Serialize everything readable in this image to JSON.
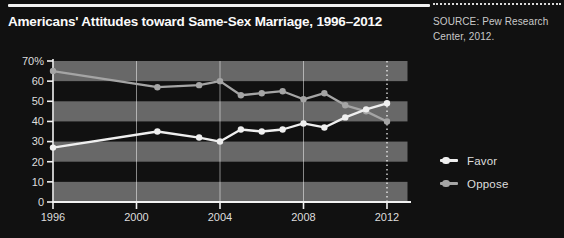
{
  "title": "Americans' Attitudes toward Same-Sex Marriage, 1996–2012",
  "source": {
    "line1": "SOURCE: Pew Research",
    "line2": "Center, 2012."
  },
  "colors": {
    "background": "#111111",
    "band": "#686868",
    "axis": "#f2f2f2",
    "tick_label": "#dedede",
    "grid": "rgba(255,255,255,0.5)",
    "grid_dotted": "rgba(255,255,255,0.85)",
    "title_text": "#fbfbfb",
    "source_text": "#c9c9c9",
    "legend_text": "#dedede"
  },
  "chart_data": {
    "type": "line",
    "title": "Americans' Attitudes toward Same-Sex Marriage, 1996–2012",
    "x": [
      1996,
      2001,
      2003,
      2004,
      2005,
      2006,
      2007,
      2008,
      2009,
      2010,
      2011,
      2012
    ],
    "series": [
      {
        "name": "Favor",
        "color": "#efefef",
        "values": [
          27,
          35,
          32,
          30,
          36,
          35,
          36,
          39,
          37,
          42,
          46,
          49
        ]
      },
      {
        "name": "Oppose",
        "color": "#a5a5a5",
        "values": [
          65,
          57,
          58,
          60,
          53,
          54,
          55,
          51,
          54,
          48,
          45,
          40
        ]
      }
    ],
    "xticks": [
      1996,
      2000,
      2004,
      2008,
      2012
    ],
    "xtick_labels": [
      "1996",
      "2000",
      "2004",
      "2008",
      "2012"
    ],
    "yticks": [
      0,
      10,
      20,
      30,
      40,
      50,
      60,
      70
    ],
    "ytick_labels": [
      "0",
      "10",
      "20",
      "30",
      "40",
      "50",
      "60",
      "70%"
    ],
    "ylim": [
      0,
      70
    ],
    "xlim": [
      1996,
      2013
    ],
    "xlabel": "",
    "ylabel": "",
    "shaded_bands": [
      [
        0,
        10
      ],
      [
        20,
        30
      ],
      [
        40,
        50
      ],
      [
        60,
        70
      ]
    ],
    "grid": "vertical gridlines at 2000, 2004, 2008 solid; 2012 dotted",
    "legend_position": "right"
  }
}
